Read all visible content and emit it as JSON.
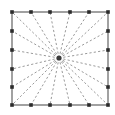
{
  "figure": {
    "type": "diagram",
    "canvas": {
      "width": 115,
      "height": 115,
      "background": "#ffffff"
    },
    "colors": {
      "boundary_line": "#555555",
      "marker_fill": "#2b2b2b",
      "ray_stroke": "#9a9a9a",
      "hub_fill": "#3a3a3a",
      "background": "#ffffff"
    },
    "square": {
      "left": 12,
      "top": 12,
      "right": 108,
      "bottom": 105,
      "stroke_width": 1.1
    },
    "hub": {
      "label": "center-hub",
      "x": 59,
      "y": 58,
      "radius": 2.6
    },
    "marker": {
      "size": 3.6,
      "shape": "square",
      "count": 20
    },
    "ray": {
      "style": "dashed",
      "dash_pattern": "2.2 2.2",
      "stroke_width": 1.0,
      "count": 20
    },
    "grid_divisions": {
      "columns": 5,
      "rows": 5
    },
    "boundary_markers": [
      {
        "name": "top-1",
        "x": 12,
        "y": 12
      },
      {
        "name": "top-2",
        "x": 31,
        "y": 12
      },
      {
        "name": "top-3",
        "x": 50,
        "y": 12
      },
      {
        "name": "top-4",
        "x": 70,
        "y": 12
      },
      {
        "name": "top-5",
        "x": 89,
        "y": 12
      },
      {
        "name": "top-6",
        "x": 108,
        "y": 12
      },
      {
        "name": "right-2",
        "x": 108,
        "y": 31
      },
      {
        "name": "right-3",
        "x": 108,
        "y": 50
      },
      {
        "name": "right-4",
        "x": 108,
        "y": 69
      },
      {
        "name": "right-5",
        "x": 108,
        "y": 87
      },
      {
        "name": "right-6",
        "x": 108,
        "y": 105
      },
      {
        "name": "bottom-5",
        "x": 89,
        "y": 105
      },
      {
        "name": "bottom-4",
        "x": 70,
        "y": 105
      },
      {
        "name": "bottom-3",
        "x": 50,
        "y": 105
      },
      {
        "name": "bottom-2",
        "x": 31,
        "y": 105
      },
      {
        "name": "bottom-1",
        "x": 12,
        "y": 105
      },
      {
        "name": "left-5",
        "x": 12,
        "y": 87
      },
      {
        "name": "left-4",
        "x": 12,
        "y": 69
      },
      {
        "name": "left-3",
        "x": 12,
        "y": 50
      },
      {
        "name": "left-2",
        "x": 12,
        "y": 31
      }
    ]
  }
}
